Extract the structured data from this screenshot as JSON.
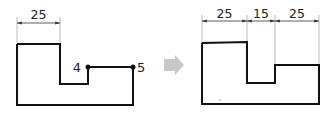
{
  "left_figure": {
    "dimension_label": "25",
    "point_labels": [
      "4",
      "5"
    ]
  },
  "arrow": {
    "color": "#c8c8c8"
  },
  "right_figure": {
    "dimension_labels": [
      "25",
      "15",
      "25"
    ]
  },
  "colors": {
    "outline": "#111111",
    "dimension": "#333333",
    "extension": "#999999"
  }
}
